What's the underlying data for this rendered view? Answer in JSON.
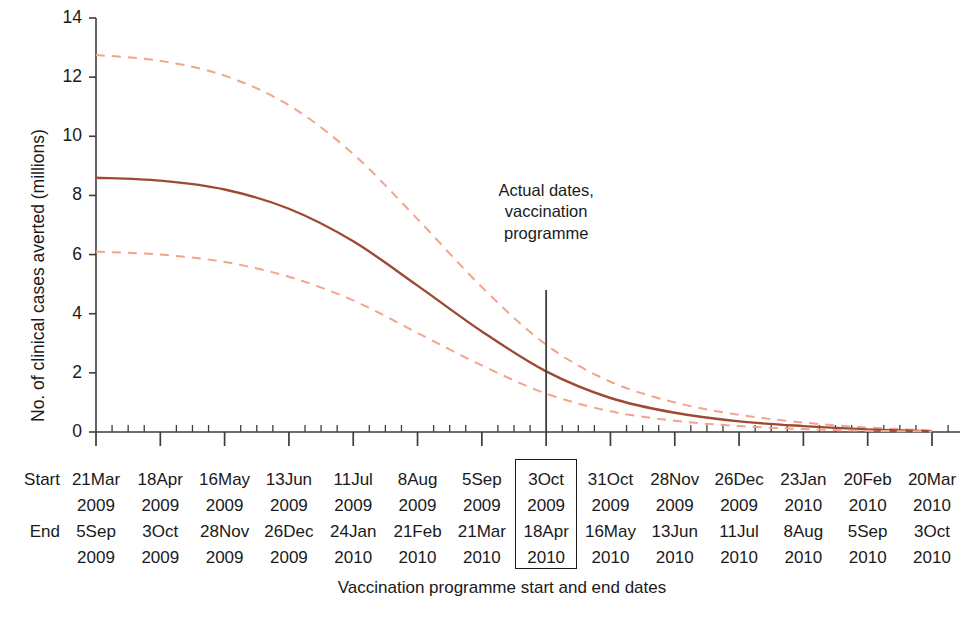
{
  "chart_data": {
    "type": "line",
    "title": "",
    "xlabel": "Vaccination programme start and end dates",
    "ylabel": "No. of clinical cases averted (millions)",
    "ylim": [
      0,
      14
    ],
    "yticks": [
      0,
      2,
      4,
      6,
      8,
      10,
      12,
      14
    ],
    "ytick_labels": [
      "0",
      "2",
      "4",
      "6",
      "8",
      "10",
      "12",
      "14"
    ],
    "grid": false,
    "legend_position": "none",
    "x_minor_ticks_per_interval": 4,
    "categories": [
      "21Mar 2009 / 5Sep 2009",
      "18Apr 2009 / 3Oct 2009",
      "16May 2009 / 28Nov 2009",
      "13Jun 2009 / 26Dec 2009",
      "11Jul 2009 / 24Jan 2010",
      "8Aug 2009 / 21Feb 2010",
      "5Sep 2009 / 21Mar 2010",
      "3Oct 2009 / 18Apr 2010",
      "31Oct 2009 / 16May 2010",
      "28Nov 2009 / 13Jun 2010",
      "26Dec 2009 / 11Jul 2010",
      "23Jan 2010 / 8Aug 2010",
      "20Feb 2010 / 5Sep 2010",
      "20Mar 2010 / 3Oct 2010"
    ],
    "x_index": [
      0,
      1,
      2,
      3,
      4,
      5,
      6,
      7,
      8,
      9,
      10,
      11,
      12,
      13
    ],
    "series": [
      {
        "name": "Upper 95% credible interval",
        "style": "dashed",
        "color": "#f0a58c",
        "values": [
          12.75,
          12.55,
          12.05,
          11.05,
          9.4,
          7.2,
          4.9,
          2.95,
          1.7,
          1.0,
          0.58,
          0.32,
          0.15,
          0.05
        ]
      },
      {
        "name": "Median estimate",
        "style": "solid",
        "color": "#9e4a33",
        "values": [
          8.6,
          8.5,
          8.2,
          7.55,
          6.45,
          4.95,
          3.4,
          2.05,
          1.15,
          0.65,
          0.36,
          0.2,
          0.09,
          0.03
        ]
      },
      {
        "name": "Lower 95% credible interval",
        "style": "dashed",
        "color": "#f0a58c",
        "values": [
          6.1,
          6.0,
          5.75,
          5.25,
          4.45,
          3.35,
          2.25,
          1.3,
          0.7,
          0.38,
          0.2,
          0.1,
          0.04,
          0.02
        ]
      }
    ],
    "annotations": [
      {
        "name": "actual-dates-marker",
        "text_lines": [
          "Actual dates,",
          "vaccination",
          "programme"
        ],
        "at_category_index": 7,
        "line_color": "#3d3d3d"
      }
    ]
  },
  "axis": {
    "y_label": "No. of clinical cases averted (millions)",
    "y_tick_labels": [
      "14",
      "12",
      "10",
      "8",
      "6",
      "4",
      "2",
      "0"
    ],
    "x_title": "Vaccination programme start and end dates"
  },
  "annotation": {
    "line1": "Actual dates,",
    "line2": "vaccination",
    "line3": "programme"
  },
  "date_table": {
    "row_labels": {
      "start": "Start",
      "end": "End"
    },
    "highlighted_index": 7,
    "columns": [
      {
        "start_day": "21Mar",
        "start_year": "2009",
        "end_day": "5Sep",
        "end_year": "2009"
      },
      {
        "start_day": "18Apr",
        "start_year": "2009",
        "end_day": "3Oct",
        "end_year": "2009"
      },
      {
        "start_day": "16May",
        "start_year": "2009",
        "end_day": "28Nov",
        "end_year": "2009"
      },
      {
        "start_day": "13Jun",
        "start_year": "2009",
        "end_day": "26Dec",
        "end_year": "2009"
      },
      {
        "start_day": "11Jul",
        "start_year": "2009",
        "end_day": "24Jan",
        "end_year": "2010"
      },
      {
        "start_day": "8Aug",
        "start_year": "2009",
        "end_day": "21Feb",
        "end_year": "2010"
      },
      {
        "start_day": "5Sep",
        "start_year": "2009",
        "end_day": "21Mar",
        "end_year": "2010"
      },
      {
        "start_day": "3Oct",
        "start_year": "2009",
        "end_day": "18Apr",
        "end_year": "2010"
      },
      {
        "start_day": "31Oct",
        "start_year": "2009",
        "end_day": "16May",
        "end_year": "2010"
      },
      {
        "start_day": "28Nov",
        "start_year": "2009",
        "end_day": "13Jun",
        "end_year": "2010"
      },
      {
        "start_day": "26Dec",
        "start_year": "2009",
        "end_day": "11Jul",
        "end_year": "2010"
      },
      {
        "start_day": "23Jan",
        "start_year": "2010",
        "end_day": "8Aug",
        "end_year": "2010"
      },
      {
        "start_day": "20Feb",
        "start_year": "2010",
        "end_day": "5Sep",
        "end_year": "2010"
      },
      {
        "start_day": "20Mar",
        "start_year": "2010",
        "end_day": "3Oct",
        "end_year": "2010"
      }
    ]
  },
  "colors": {
    "median_line": "#9e4a33",
    "interval_line": "#f0a58c",
    "axis": "#3d3d3d",
    "text": "#1a1a1a"
  }
}
